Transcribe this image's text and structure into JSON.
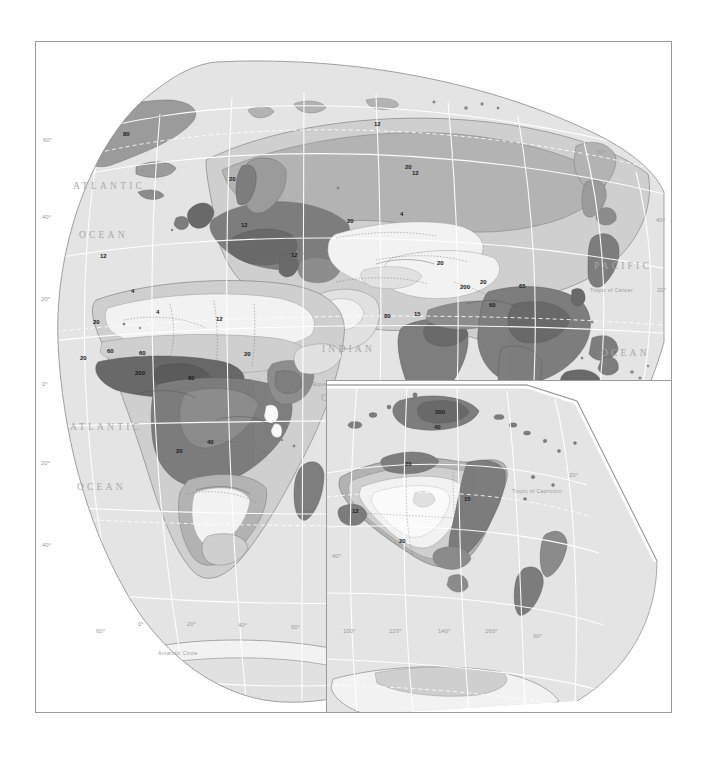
{
  "document": {
    "type": "world-thematic-map",
    "subject": "Population density choropleth (persons per square kilometre)",
    "background_color": "#ffffff",
    "frame_color": "#9a9a9a"
  },
  "palette": {
    "ocean": "#e4e4e4",
    "land_lightest": "#f2f2f2",
    "land_very_light": "#e1e1e1",
    "land_light": "#cfcfcf",
    "land_mid": "#b4b4b4",
    "land_mid_dark": "#9b9b9b",
    "land_dark": "#7e7e7e",
    "land_darkest": "#6a6a6a",
    "graticule": "#ffffff",
    "coastline": "#6f6f6f",
    "border_dotted": "#707070",
    "inset_border": "#ffffff"
  },
  "panels": [
    {
      "id": "main-panel",
      "name": "World map — Eurasia, Africa, Antarctica"
    },
    {
      "id": "inset-panel",
      "name": "Inset map — Australia, New Zealand, Antarctica"
    }
  ],
  "main_map": {
    "ocean_labels": [
      {
        "text": "ATLANTIC",
        "x": 72,
        "y": 188
      },
      {
        "text": "OCEAN",
        "x": 78,
        "y": 237
      },
      {
        "text": "ATLANTIC",
        "x": 69,
        "y": 429
      },
      {
        "text": "OCEAN",
        "x": 76,
        "y": 489
      },
      {
        "text": "INDIAN",
        "x": 321,
        "y": 351
      },
      {
        "text": "OCEAN",
        "x": 320,
        "y": 400
      },
      {
        "text": "PACIFIC",
        "x": 593,
        "y": 268
      },
      {
        "text": "OCEAN",
        "x": 600,
        "y": 355
      }
    ],
    "special_lines": [
      {
        "text": "Arctic Circle",
        "x": 130,
        "y": 117
      },
      {
        "text": "Equator",
        "x": 312,
        "y": 385
      },
      {
        "text": "Tropic of Cancer",
        "x": 589,
        "y": 291
      },
      {
        "text": "Antarctic Circle",
        "x": 157,
        "y": 654
      }
    ],
    "latitude_labels_left": [
      {
        "text": "60°",
        "x": 42,
        "y": 141
      },
      {
        "text": "40°",
        "x": 41,
        "y": 218
      },
      {
        "text": "20°",
        "x": 40,
        "y": 300
      },
      {
        "text": "0°",
        "x": 41,
        "y": 385
      },
      {
        "text": "20°",
        "x": 40,
        "y": 464
      },
      {
        "text": "40°",
        "x": 41,
        "y": 546
      }
    ],
    "latitude_labels_right": [
      {
        "text": "60°",
        "x": 596,
        "y": 153
      },
      {
        "text": "40°",
        "x": 655,
        "y": 221
      },
      {
        "text": "20°",
        "x": 656,
        "y": 291
      },
      {
        "text": "0°",
        "x": 641,
        "y": 385
      }
    ],
    "longitude_labels_bottom": [
      {
        "text": "60°",
        "x": 95,
        "y": 632
      },
      {
        "text": "0°",
        "x": 137,
        "y": 625
      },
      {
        "text": "20°",
        "x": 186,
        "y": 625
      },
      {
        "text": "40°",
        "x": 237,
        "y": 626
      },
      {
        "text": "60°",
        "x": 290,
        "y": 628
      }
    ],
    "contour_labels": [
      {
        "text": "80",
        "x": 122,
        "y": 135
      },
      {
        "text": "12",
        "x": 373,
        "y": 125
      },
      {
        "text": "20",
        "x": 228,
        "y": 180
      },
      {
        "text": "12",
        "x": 411,
        "y": 174
      },
      {
        "text": "20",
        "x": 404,
        "y": 168
      },
      {
        "text": "12",
        "x": 240,
        "y": 226
      },
      {
        "text": "20",
        "x": 346,
        "y": 222
      },
      {
        "text": "4",
        "x": 399,
        "y": 215
      },
      {
        "text": "12",
        "x": 99,
        "y": 257
      },
      {
        "text": "12",
        "x": 290,
        "y": 256
      },
      {
        "text": "20",
        "x": 436,
        "y": 264
      },
      {
        "text": "4",
        "x": 130,
        "y": 292
      },
      {
        "text": "4",
        "x": 155,
        "y": 313
      },
      {
        "text": "12",
        "x": 215,
        "y": 320
      },
      {
        "text": "20",
        "x": 92,
        "y": 323
      },
      {
        "text": "20",
        "x": 479,
        "y": 283
      },
      {
        "text": "200",
        "x": 459,
        "y": 288
      },
      {
        "text": "80",
        "x": 383,
        "y": 317
      },
      {
        "text": "15",
        "x": 413,
        "y": 315
      },
      {
        "text": "60",
        "x": 488,
        "y": 306
      },
      {
        "text": "65",
        "x": 518,
        "y": 287
      },
      {
        "text": "60",
        "x": 106,
        "y": 352
      },
      {
        "text": "60",
        "x": 138,
        "y": 354
      },
      {
        "text": "20",
        "x": 79,
        "y": 359
      },
      {
        "text": "200",
        "x": 134,
        "y": 374
      },
      {
        "text": "80",
        "x": 187,
        "y": 379
      },
      {
        "text": "20",
        "x": 243,
        "y": 355
      },
      {
        "text": "40",
        "x": 206,
        "y": 443
      },
      {
        "text": "20",
        "x": 175,
        "y": 452
      },
      {
        "text": "65",
        "x": 566,
        "y": 407
      }
    ]
  },
  "inset_map": {
    "special_lines": [
      {
        "text": "Tropic of Capricorn",
        "x": 515,
        "y": 489
      }
    ],
    "latitude_labels": [
      {
        "text": "20°",
        "x": 571,
        "y": 473
      },
      {
        "text": "40°",
        "x": 334,
        "y": 554
      },
      {
        "text": "60°",
        "x": 534,
        "y": 634
      }
    ],
    "longitude_labels": [
      {
        "text": "100°",
        "x": 345,
        "y": 629
      },
      {
        "text": "120°",
        "x": 391,
        "y": 629
      },
      {
        "text": "140°",
        "x": 440,
        "y": 629
      },
      {
        "text": "160°",
        "x": 487,
        "y": 629
      }
    ],
    "contour_labels": [
      {
        "text": "200",
        "x": 438,
        "y": 410
      },
      {
        "text": "40",
        "x": 435,
        "y": 425
      },
      {
        "text": "20",
        "x": 406,
        "y": 462
      },
      {
        "text": "12",
        "x": 353,
        "y": 509
      },
      {
        "text": "15",
        "x": 465,
        "y": 497
      },
      {
        "text": "20",
        "x": 400,
        "y": 539
      }
    ]
  }
}
